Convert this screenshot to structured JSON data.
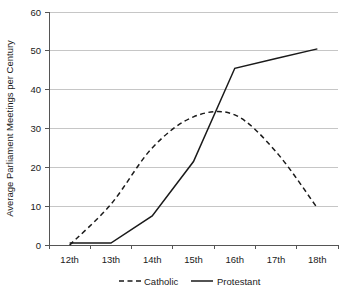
{
  "chart_data": {
    "type": "line",
    "title": "",
    "xlabel": "",
    "ylabel": "Average Parliament Meetings per Century",
    "categories": [
      "12th",
      "13th",
      "14th",
      "15th",
      "16th",
      "17th",
      "18th"
    ],
    "ylim": [
      0,
      60
    ],
    "yticks": [
      0,
      10,
      20,
      30,
      40,
      50,
      60
    ],
    "ytick_labels": [
      "0",
      "10",
      "20",
      "30",
      "40",
      "50",
      "60"
    ],
    "grid": true,
    "legend_position": "bottom",
    "series": [
      {
        "name": "Catholic",
        "style": "dashed",
        "color": "#1a1a1a",
        "values": [
          0,
          10.5,
          25,
          33,
          33.5,
          24,
          9.5
        ]
      },
      {
        "name": "Protestant",
        "style": "solid",
        "color": "#1a1a1a",
        "values": [
          0.5,
          0.5,
          7.5,
          21.5,
          45.5,
          48,
          50.5
        ]
      }
    ],
    "annotations": []
  },
  "legend": {
    "items": [
      {
        "label": "Catholic",
        "style": "dashed"
      },
      {
        "label": "Protestant",
        "style": "solid"
      }
    ]
  },
  "axes": {
    "y_title": "Average Parliament Meetings per Century",
    "y_tick_labels": [
      "60",
      "50",
      "40",
      "30",
      "20",
      "10",
      "0"
    ],
    "x_tick_labels": [
      "12th",
      "13th",
      "14th",
      "15th",
      "16th",
      "17th",
      "18th"
    ]
  },
  "colors": {
    "line": "#1a1a1a",
    "gridline": "#b8b8b8",
    "axis": "#555555",
    "background": "#ffffff"
  }
}
